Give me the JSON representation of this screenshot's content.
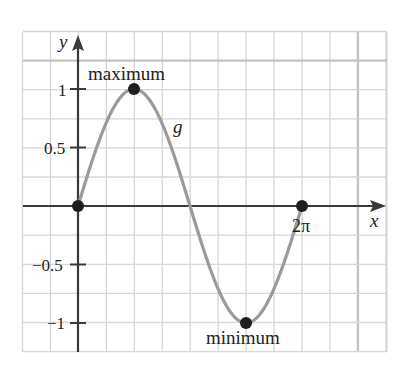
{
  "chart_data": {
    "type": "line",
    "title": "",
    "xlabel": "x",
    "ylabel": "y",
    "function_label": "g",
    "function": "sin(x)",
    "x_range": [
      0,
      6.283185307
    ],
    "xlim": [
      -1.96,
      11.07
    ],
    "ylim": [
      -1.25,
      1.5
    ],
    "x_tick_labels": [
      {
        "value": 6.283185307,
        "label": "2π"
      }
    ],
    "y_tick_labels": [
      {
        "value": 1,
        "label": "1"
      },
      {
        "value": 0.5,
        "label": "0.5"
      },
      {
        "value": -0.5,
        "label": "−0.5"
      },
      {
        "value": -1,
        "label": "−1"
      }
    ],
    "grid": true,
    "points": [
      {
        "x": 0,
        "y": 0,
        "label": ""
      },
      {
        "x": 1.5708,
        "y": 1,
        "label": "maximum"
      },
      {
        "x": 4.7124,
        "y": -1,
        "label": "minimum"
      },
      {
        "x": 6.2832,
        "y": 0,
        "label": ""
      }
    ],
    "sample_values": {
      "x": [
        0,
        0.785,
        1.571,
        2.356,
        3.142,
        3.927,
        4.712,
        5.498,
        6.283
      ],
      "y": [
        0,
        0.707,
        1,
        0.707,
        0,
        -0.707,
        -1,
        -0.707,
        0
      ]
    },
    "colors": {
      "curve": "#9a9a9a",
      "axes": "#3a3a3a",
      "grid": "#d6d6d6",
      "grid_major": "#c4c4c4",
      "points": "#1e1e1e",
      "function_label": "#8c8c8c"
    }
  }
}
